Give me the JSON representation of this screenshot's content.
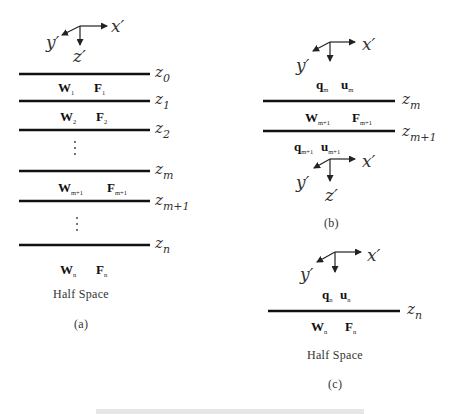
{
  "axes_labels": {
    "x": "x′",
    "y": "y′",
    "z": "z′"
  },
  "panel_a": {
    "caption": "(a)",
    "interfaces": [
      {
        "z": "z",
        "sub": "0"
      },
      {
        "z": "z",
        "sub": "1"
      },
      {
        "z": "z",
        "sub": "2"
      },
      {
        "z": "z",
        "sub": "m"
      },
      {
        "z": "z",
        "sub": "m+1"
      },
      {
        "z": "z",
        "sub": "n"
      }
    ],
    "layers": [
      {
        "w": "W",
        "w_sub": "1",
        "f": "F",
        "f_sub": "1"
      },
      {
        "w": "W",
        "w_sub": "2",
        "f": "F",
        "f_sub": "2"
      },
      {
        "w": "W",
        "w_sub": "m+1",
        "f": "F",
        "f_sub": "m+1"
      },
      {
        "w": "W",
        "w_sub": "n",
        "f": "F",
        "f_sub": "n"
      }
    ],
    "ellipsis": "⋮",
    "half_space": "Half Space"
  },
  "panel_b": {
    "caption": "(b)",
    "interfaces": [
      {
        "z": "z",
        "sub": "m"
      },
      {
        "z": "z",
        "sub": "m+1"
      }
    ],
    "top_vectors": {
      "q": "q",
      "q_sub": "m",
      "u": "u",
      "u_sub": "m"
    },
    "layer": {
      "w": "W",
      "w_sub": "m+1",
      "f": "F",
      "f_sub": "m+1"
    },
    "bottom_vectors": {
      "q": "q",
      "q_sub": "m+1",
      "u": "u",
      "u_sub": "m+1"
    }
  },
  "panel_c": {
    "caption": "(c)",
    "interface": {
      "z": "z",
      "sub": "n"
    },
    "top_vectors": {
      "q": "q",
      "q_sub": "n",
      "u": "u",
      "u_sub": "n"
    },
    "layer": {
      "w": "W",
      "w_sub": "n",
      "f": "F",
      "f_sub": "n"
    },
    "half_space": "Half Space"
  }
}
